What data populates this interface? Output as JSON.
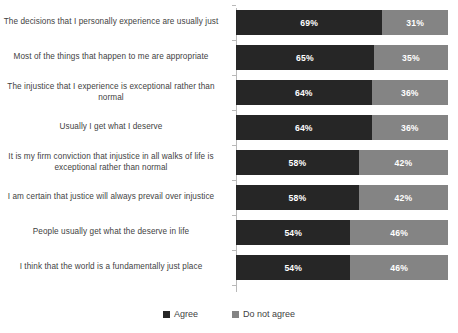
{
  "chart_data": {
    "type": "bar",
    "orientation": "horizontal",
    "stacked": true,
    "stacked_percent": true,
    "title": "",
    "subtitle": "",
    "xlabel": "",
    "ylabel": "",
    "xlim": [
      0,
      100
    ],
    "grid": false,
    "legend_position": "bottom",
    "categories": [
      "The decisions that I personally experience are usually just",
      "Most of the things that happen to me are appropriate",
      "The injustice that I experience is exceptional rather than normal",
      "Usually I get what I deserve",
      "It is my firm conviction that injustice in all walks of life is exceptional rather than normal",
      "I am certain that justice will always prevail over injustice",
      "People usually get what the deserve in life",
      "I think that the world is a fundamentally just place"
    ],
    "series": [
      {
        "name": "Agree",
        "color": "#262626",
        "values": [
          69,
          65,
          64,
          64,
          58,
          58,
          54,
          54
        ],
        "labels": [
          "69%",
          "65%",
          "64%",
          "64%",
          "58%",
          "58%",
          "54%",
          "54%"
        ]
      },
      {
        "name": "Do not agree",
        "color": "#848484",
        "values": [
          31,
          35,
          36,
          36,
          42,
          42,
          46,
          46
        ],
        "labels": [
          "31%",
          "35%",
          "36%",
          "36%",
          "42%",
          "42%",
          "46%",
          "46%"
        ]
      }
    ]
  },
  "legend": {
    "items": [
      {
        "label": "Agree",
        "color": "#262626"
      },
      {
        "label": "Do not agree",
        "color": "#848484"
      }
    ]
  }
}
